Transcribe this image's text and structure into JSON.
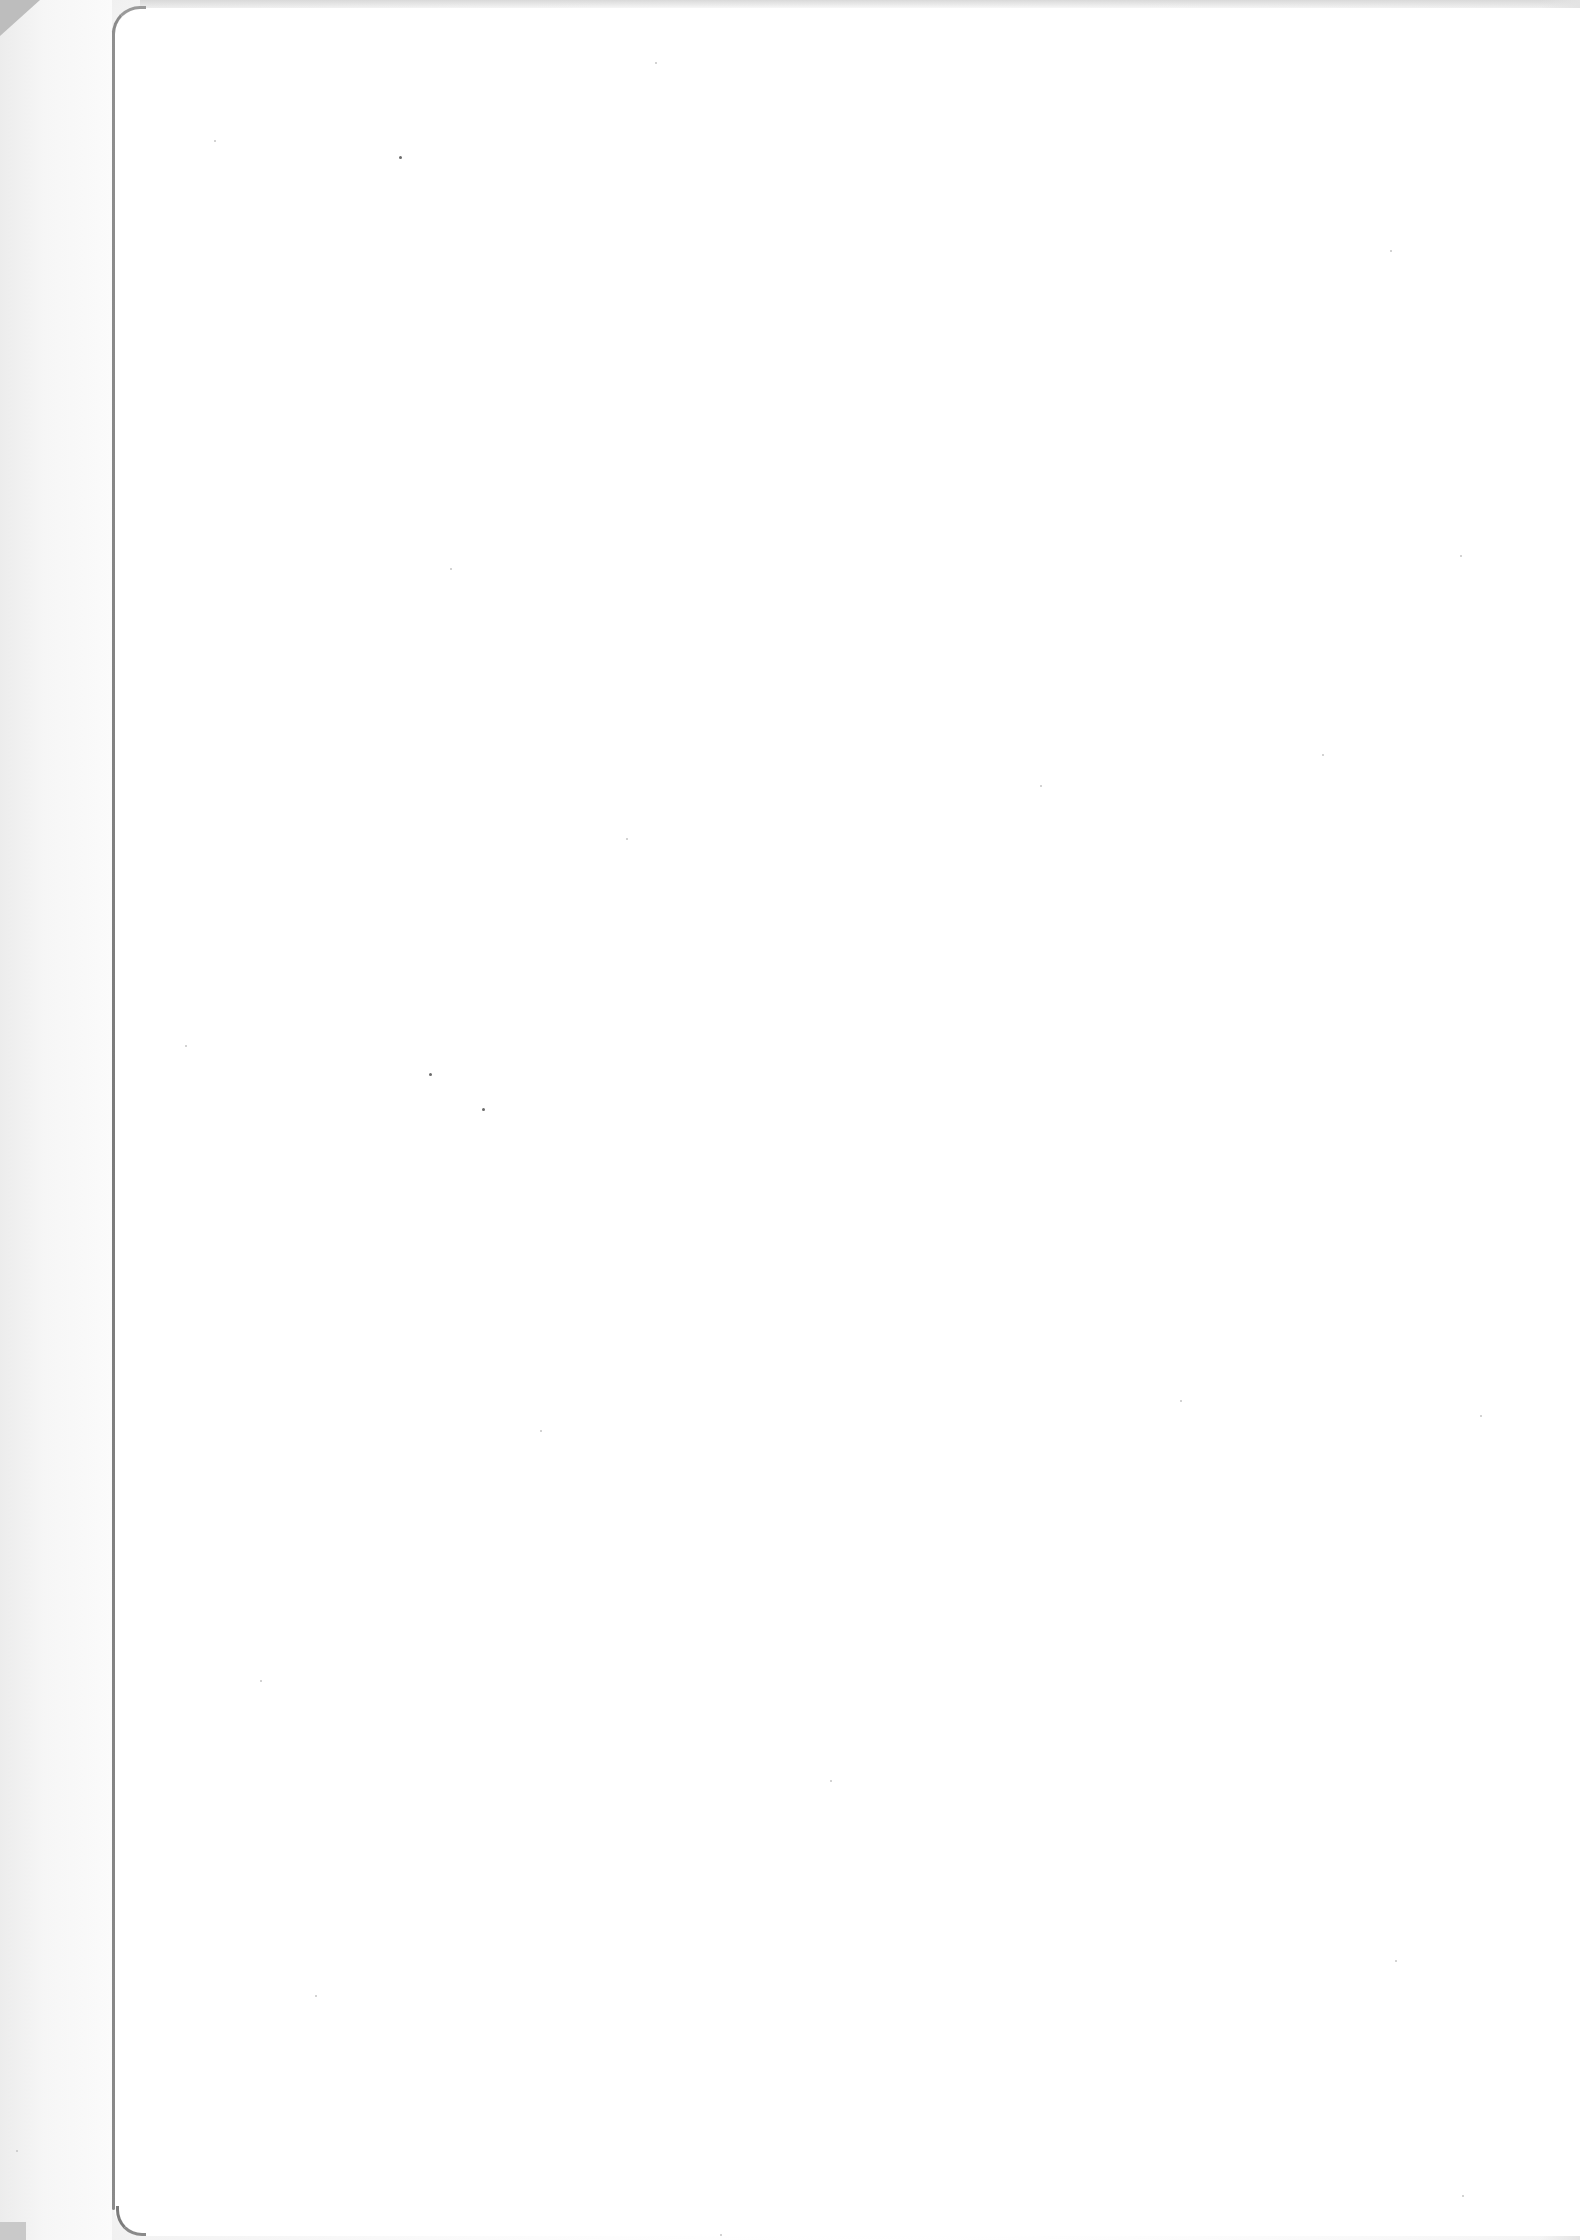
{
  "document": {
    "type": "scanned-page",
    "content": "",
    "is_blank": true
  },
  "colors": {
    "paper": "#ffffff",
    "margin_shade": "#ececec",
    "fold_line": "#7a7a7a"
  }
}
